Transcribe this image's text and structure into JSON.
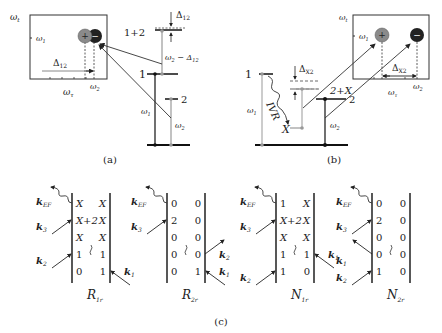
{
  "panel_a": {
    "caption": "(a)",
    "inset": {
      "y_axis": "ω",
      "y_axis_sub": "t",
      "x_axis": "ω",
      "x_axis_sub": "τ",
      "y_tick": "ω",
      "y_tick_sub": "1",
      "x_tick": "ω",
      "x_tick_sub": "2",
      "delta": "Δ",
      "delta_sub": "12",
      "peaks": [
        {
          "sign": "+",
          "color": "#8a8a8a"
        },
        {
          "sign": "−",
          "color": "#222222"
        }
      ]
    },
    "levels": {
      "combo": "1+2",
      "level1": "1",
      "level2": "2",
      "shift": "Δ",
      "shift_sub": "12",
      "transition": "ω",
      "transition_sub": "2",
      "transition_suffix": " − Δ",
      "transition_suffix_sub": "12",
      "w1": "ω",
      "w1_sub": "1",
      "w2": "ω",
      "w2_sub": "2"
    }
  },
  "panel_b": {
    "caption": "(b)",
    "inset": {
      "y_axis": "ω",
      "y_axis_sub": "t",
      "x_axis": "ω",
      "x_axis_sub": "τ",
      "y_tick": "ω",
      "y_tick_sub": "1",
      "x_tick": "ω",
      "x_tick_sub": "2",
      "delta": "Δ",
      "delta_sub": "X2",
      "peaks": [
        {
          "sign": "+",
          "color": "#8a8a8a"
        },
        {
          "sign": "−",
          "color": "#222222"
        }
      ]
    },
    "levels": {
      "level1": "1",
      "levelX": "X",
      "level2": "2",
      "combo": "2+X",
      "ivr": "IVR",
      "shift": "Δ",
      "shift_sub": "X2",
      "w1": "ω",
      "w1_sub": "1",
      "w2": "ω",
      "w2_sub": "2"
    }
  },
  "panel_c": {
    "caption": "(c)",
    "diagrams": [
      {
        "name": "R",
        "sub": "1r",
        "rows": [
          [
            "X",
            "X"
          ],
          [
            "X+2",
            "X"
          ],
          [
            "X",
            "X"
          ],
          [
            "1",
            "1"
          ],
          [
            "0",
            "1"
          ]
        ],
        "left": [
          {
            "k": "EF",
            "row": 0,
            "type": "emit"
          },
          {
            "k": "3",
            "row": 1,
            "type": "in"
          },
          {
            "k": "2",
            "row": 3,
            "type": "in"
          }
        ],
        "right": [
          {
            "k": "1",
            "row": 4,
            "type": "in"
          }
        ]
      },
      {
        "name": "R",
        "sub": "2r",
        "rows": [
          [
            "0",
            "0"
          ],
          [
            "2",
            "0"
          ],
          [
            "0",
            "0"
          ],
          [
            "0",
            "0"
          ],
          [
            "0",
            "1"
          ]
        ],
        "left": [
          {
            "k": "EF",
            "row": 0,
            "type": "emit"
          },
          {
            "k": "3",
            "row": 1,
            "type": "in"
          }
        ],
        "right": [
          {
            "k": "2",
            "row": 3,
            "type": "out"
          },
          {
            "k": "1",
            "row": 4,
            "type": "in"
          }
        ]
      },
      {
        "name": "N",
        "sub": "1r",
        "rows": [
          [
            "1",
            "X"
          ],
          [
            "X+2",
            "X"
          ],
          [
            "X",
            "X"
          ],
          [
            "1",
            "1"
          ],
          [
            "1",
            "0"
          ]
        ],
        "left": [
          {
            "k": "EF",
            "row": 0,
            "type": "emit"
          },
          {
            "k": "3",
            "row": 1,
            "type": "in"
          },
          {
            "k": "2",
            "row": 4,
            "type": "in"
          }
        ],
        "right": [
          {
            "k": "1",
            "row": 3,
            "type": "in"
          }
        ]
      },
      {
        "name": "N",
        "sub": "2r",
        "rows": [
          [
            "0",
            "0"
          ],
          [
            "2",
            "0"
          ],
          [
            "0",
            "0"
          ],
          [
            "0",
            "0"
          ],
          [
            "1",
            "0"
          ]
        ],
        "left": [
          {
            "k": "EF",
            "row": 0,
            "type": "emit"
          },
          {
            "k": "3",
            "row": 1,
            "type": "in"
          },
          {
            "k": "1",
            "row": 3,
            "type": "out"
          },
          {
            "k": "2",
            "row": 4,
            "type": "in"
          }
        ],
        "right": []
      }
    ],
    "k_symbol": "k"
  }
}
